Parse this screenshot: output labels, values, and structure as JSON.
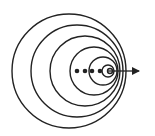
{
  "diagram": {
    "title": "",
    "colors": {
      "stroke": "#222222",
      "background": "#ffffff"
    },
    "wavefronts": [
      {
        "cx": 69,
        "cy": 71,
        "r": 57
      },
      {
        "cx": 77,
        "cy": 71,
        "r": 46
      },
      {
        "cx": 85,
        "cy": 71,
        "r": 35
      },
      {
        "cx": 94,
        "cy": 71,
        "r": 24
      },
      {
        "cx": 103,
        "cy": 71,
        "r": 14
      },
      {
        "cx": 108,
        "cy": 71,
        "r": 6
      },
      {
        "cx": 110,
        "cy": 71,
        "r": 2.5
      }
    ],
    "source_positions": [
      {
        "cx": 77,
        "cy": 71,
        "r": 2.3
      },
      {
        "cx": 85,
        "cy": 71,
        "r": 2.3
      },
      {
        "cx": 92,
        "cy": 71,
        "r": 2.3
      },
      {
        "cx": 100,
        "cy": 71,
        "r": 2.3
      }
    ],
    "motion_arrow": {
      "x1": 108,
      "y1": 71,
      "x2": 145,
      "y2": 71,
      "direction": "right"
    }
  }
}
